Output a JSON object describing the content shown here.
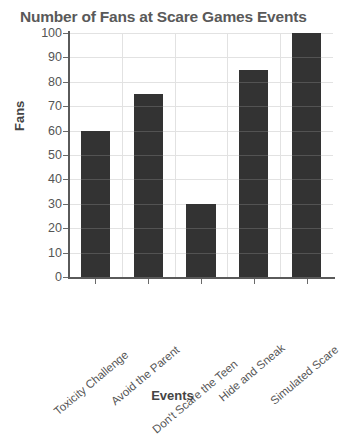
{
  "chart_data": {
    "type": "bar",
    "title": "Number of Fans at Scare Games Events",
    "xlabel": "Events",
    "ylabel": "Fans",
    "categories": [
      "Toxicity Challenge",
      "Avoid the Parent",
      "Don't Scare the Teen",
      "Hide and Sneak",
      "Simulated Scare"
    ],
    "values": [
      60,
      75,
      30,
      85,
      100
    ],
    "ylim": [
      0,
      100
    ],
    "ytick_values": [
      0,
      10,
      20,
      30,
      40,
      50,
      60,
      70,
      80,
      90,
      100
    ],
    "ytick_labels": [
      "0",
      "10",
      "20",
      "30",
      "40",
      "50",
      "60",
      "70",
      "80",
      "90",
      "100"
    ],
    "grid": true,
    "legend": false,
    "bar_color": "#333333",
    "grid_color": "#e2e2e2",
    "axis_color": "#5a5a5a",
    "title_color": "#595959",
    "background": "#ffffff"
  }
}
